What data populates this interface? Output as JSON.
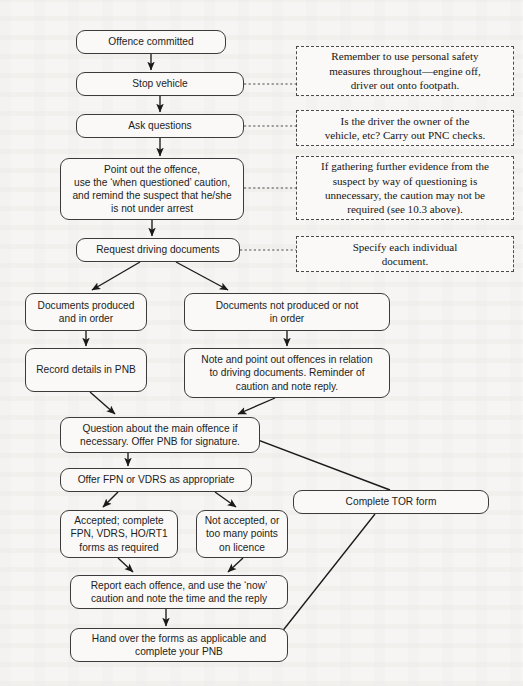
{
  "style": {
    "page_background": "#f6f5f3",
    "box_background": "#faf9f7",
    "box_border": "#3b3b3b",
    "note_border": "#4a4a4a",
    "text_color": "#1d1d1d",
    "connector_color": "#1a1a1a"
  },
  "nodes": [
    {
      "id": "offence_committed",
      "label": "Offence committed",
      "x": 76,
      "y": 30,
      "w": 150,
      "h": 24
    },
    {
      "id": "stop_vehicle",
      "label": "Stop vehicle",
      "x": 76,
      "y": 72,
      "w": 168,
      "h": 24
    },
    {
      "id": "ask_questions",
      "label": "Ask questions",
      "x": 76,
      "y": 114,
      "w": 168,
      "h": 24
    },
    {
      "id": "point_out_offence",
      "label": "Point out the offence,\nuse the ‘when questioned’ caution,\nand remind the suspect that he/she\nis not under arrest",
      "x": 60,
      "y": 158,
      "w": 184,
      "h": 62
    },
    {
      "id": "request_documents",
      "label": "Request driving documents",
      "x": 76,
      "y": 238,
      "w": 164,
      "h": 24
    },
    {
      "id": "docs_produced",
      "label": "Documents produced\nand in order",
      "x": 25,
      "y": 293,
      "w": 122,
      "h": 38
    },
    {
      "id": "docs_not_produced",
      "label": "Documents not produced or not\nin order",
      "x": 184,
      "y": 293,
      "w": 206,
      "h": 38
    },
    {
      "id": "record_pnb",
      "label": "Record details in PNB",
      "x": 25,
      "y": 348,
      "w": 122,
      "h": 44
    },
    {
      "id": "note_offences",
      "label": "Note and point out offences in relation\nto driving documents. Reminder of\ncaution and note reply.",
      "x": 184,
      "y": 348,
      "w": 206,
      "h": 50
    },
    {
      "id": "question_main",
      "label": "Question about the main offence if\nnecessary.  Offer PNB for signature.",
      "x": 60,
      "y": 417,
      "w": 200,
      "h": 36
    },
    {
      "id": "offer_fpn_vdrs",
      "label": "Offer FPN or VDRS as appropriate",
      "x": 60,
      "y": 468,
      "w": 192,
      "h": 24
    },
    {
      "id": "accepted_complete",
      "label": "Accepted; complete\nFPN, VDRS, HO/RT1\nforms as required",
      "x": 60,
      "y": 510,
      "w": 118,
      "h": 48
    },
    {
      "id": "not_accepted",
      "label": "Not accepted, or\ntoo many points\non licence",
      "x": 196,
      "y": 510,
      "w": 92,
      "h": 48
    },
    {
      "id": "report_offence",
      "label": "Report each offence, and use the ‘now’\ncaution and note the time and the reply",
      "x": 70,
      "y": 575,
      "w": 218,
      "h": 34
    },
    {
      "id": "hand_over_forms",
      "label": "Hand over the forms as applicable and\ncomplete your PNB",
      "x": 70,
      "y": 628,
      "w": 218,
      "h": 34
    },
    {
      "id": "complete_tor",
      "label": "Complete  TOR form",
      "x": 293,
      "y": 490,
      "w": 196,
      "h": 24
    }
  ],
  "notes": [
    {
      "id": "note_personal_safety",
      "label": "Remember to use personal safety\nmeasures throughout—engine off,\ndriver out onto footpath.",
      "x": 296,
      "y": 46,
      "w": 218,
      "h": 50
    },
    {
      "id": "note_pnc_checks",
      "label": "Is the driver the owner of the\nvehicle, etc? Carry out PNC checks.",
      "x": 296,
      "y": 110,
      "w": 218,
      "h": 36
    },
    {
      "id": "note_caution",
      "label": "If gathering further evidence from the\nsuspect by way of questioning is\nunnecessary, the caution may not be\nrequired (see 10.3 above).",
      "x": 296,
      "y": 156,
      "w": 218,
      "h": 64
    },
    {
      "id": "note_specify_doc",
      "label": "Specify each individual\ndocument.",
      "x": 296,
      "y": 236,
      "w": 218,
      "h": 36
    }
  ],
  "connectors": [
    {
      "id": "c-offence-to-stop",
      "from": "offence_committed",
      "to": "stop_vehicle",
      "kind": "arrow-down"
    },
    {
      "id": "c-stop-to-ask",
      "from": "stop_vehicle",
      "to": "ask_questions",
      "kind": "arrow-down"
    },
    {
      "id": "c-ask-to-point",
      "from": "ask_questions",
      "to": "point_out_offence",
      "kind": "arrow-down"
    },
    {
      "id": "c-point-to-request",
      "from": "point_out_offence",
      "to": "request_documents",
      "kind": "arrow-down"
    },
    {
      "id": "c-request-to-produced",
      "from": "request_documents",
      "to": "docs_produced",
      "kind": "arrow-diagonal"
    },
    {
      "id": "c-request-to-notproduced",
      "from": "request_documents",
      "to": "docs_not_produced",
      "kind": "arrow-diagonal"
    },
    {
      "id": "c-produced-to-record",
      "from": "docs_produced",
      "to": "record_pnb",
      "kind": "arrow-down"
    },
    {
      "id": "c-notproduced-to-note",
      "from": "docs_not_produced",
      "to": "note_offences",
      "kind": "arrow-down"
    },
    {
      "id": "c-record-to-question",
      "from": "record_pnb",
      "to": "question_main",
      "kind": "arrow-diagonal"
    },
    {
      "id": "c-note-to-question",
      "from": "note_offences",
      "to": "question_main",
      "kind": "arrow-diagonal"
    },
    {
      "id": "c-question-to-offer",
      "from": "question_main",
      "to": "offer_fpn_vdrs",
      "kind": "arrow-down"
    },
    {
      "id": "c-question-to-tor",
      "from": "question_main",
      "to": "complete_tor",
      "kind": "line-plain"
    },
    {
      "id": "c-offer-to-accepted",
      "from": "offer_fpn_vdrs",
      "to": "accepted_complete",
      "kind": "arrow-diagonal"
    },
    {
      "id": "c-offer-to-notaccepted",
      "from": "offer_fpn_vdrs",
      "to": "not_accepted",
      "kind": "arrow-diagonal"
    },
    {
      "id": "c-accepted-to-report",
      "from": "accepted_complete",
      "to": "report_offence",
      "kind": "arrow-diagonal"
    },
    {
      "id": "c-notaccepted-to-report",
      "from": "not_accepted",
      "to": "report_offence",
      "kind": "arrow-diagonal"
    },
    {
      "id": "c-report-to-hand",
      "from": "report_offence",
      "to": "hand_over_forms",
      "kind": "arrow-down"
    },
    {
      "id": "c-tor-to-hand",
      "from": "complete_tor",
      "to": "hand_over_forms",
      "kind": "line-plain"
    },
    {
      "id": "c-stop-to-note-safety",
      "from": "stop_vehicle",
      "to": "note_personal_safety",
      "kind": "dotted"
    },
    {
      "id": "c-ask-to-note-pnc",
      "from": "ask_questions",
      "to": "note_pnc_checks",
      "kind": "dotted"
    },
    {
      "id": "c-point-to-note-caution",
      "from": "point_out_offence",
      "to": "note_caution",
      "kind": "dotted"
    },
    {
      "id": "c-request-to-note-doc",
      "from": "request_documents",
      "to": "note_specify_doc",
      "kind": "dotted"
    }
  ]
}
